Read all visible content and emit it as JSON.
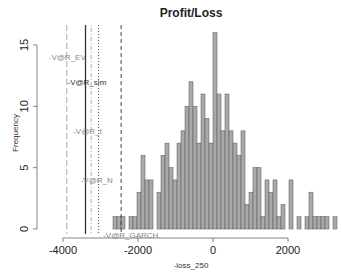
{
  "chart_data": {
    "type": "bar",
    "subtype": "histogram",
    "title": "Profit/Loss",
    "xlabel": "-loss_250",
    "ylabel": "Frequency",
    "x_ticks": [
      -4000,
      -2000,
      0,
      2000
    ],
    "y_ticks": [
      0,
      5,
      10,
      15
    ],
    "xlim": [
      -4000,
      3200
    ],
    "ylim": [
      0,
      16
    ],
    "grid": false,
    "bin_start": -2700,
    "bin_width": 107,
    "counts": [
      1,
      1,
      1,
      0,
      1,
      1,
      3,
      6,
      4,
      4,
      0,
      3,
      6,
      7,
      5,
      4,
      7,
      8,
      10,
      12,
      10,
      7,
      11,
      9,
      7,
      16,
      11,
      8,
      11,
      8,
      7,
      6,
      8,
      2,
      3,
      5,
      5,
      1,
      4,
      3,
      4,
      1,
      2,
      0,
      4,
      0,
      1,
      0,
      1,
      3,
      1,
      1,
      1,
      1,
      0,
      1
    ],
    "bar_color": "#a9a9a9",
    "bar_edge_color": "#555555",
    "vlines": [
      {
        "label": "-V@R_EV",
        "x": -3900,
        "style": "longdash",
        "color": "#aaaaaa",
        "label_y": 14
      },
      {
        "label": "-V@R_sim",
        "x": -3400,
        "style": "solid",
        "color": "#333333",
        "label_y": 12
      },
      {
        "label": "-V@R_t",
        "x": -3250,
        "style": "dotdash",
        "color": "#aaaaaa",
        "label_y": 8
      },
      {
        "label": "-V@R_N",
        "x": -3050,
        "style": "dotted",
        "color": "#555555",
        "label_y": 4
      },
      {
        "label": "-V@R_GARCH",
        "x": -2450,
        "style": "dashed",
        "color": "#444444",
        "label_y": -0.5
      }
    ]
  },
  "layout": {
    "plot_left": 63,
    "plot_right": 333,
    "x0_px": 213,
    "px_per_unit_x": 0.0375,
    "y0_px": 229,
    "px_per_unit_y": 12.27,
    "vline_top": 25,
    "vline_bottom": 234,
    "bar_x_start": 113,
    "bar_px_width": 4.0
  }
}
